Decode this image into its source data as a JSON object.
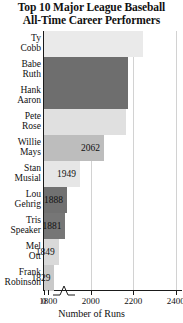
{
  "chart_data": {
    "type": "bar",
    "orientation": "horizontal",
    "title": "Top 10 Major League Baseball All-Time Career Performers",
    "title_lines": [
      "Top 10 Major League Baseball",
      "All-Time Career Performers"
    ],
    "xlabel": "Number of Runs",
    "ylabel": "",
    "categories": [
      "Ty Cobb",
      "Babe Ruth",
      "Hank Aaron",
      "Pete Rose",
      "Willie Mays",
      "Stan Musial",
      "Lou Gehrig",
      "Tris Speaker",
      "Mel Ott",
      "Frank Robinson"
    ],
    "category_lines": [
      [
        "Ty",
        "Cobb"
      ],
      [
        "Babe",
        "Ruth"
      ],
      [
        "Hank",
        "Aaron"
      ],
      [
        "Pete",
        "Rose"
      ],
      [
        "Willie",
        "Mays"
      ],
      [
        "Stan",
        "Musial"
      ],
      [
        "Lou",
        "Gehrig"
      ],
      [
        "Tris",
        "Speaker"
      ],
      [
        "Mel",
        "Ott"
      ],
      [
        "Frank",
        "Robinson"
      ]
    ],
    "values": [
      2246,
      2174,
      2174,
      2165,
      2062,
      1949,
      1888,
      1881,
      1849,
      1829
    ],
    "value_labels": [
      "",
      "",
      "",
      "",
      "2062",
      "1949",
      "1888",
      "1881",
      "1849",
      "1829"
    ],
    "bar_colors": [
      "#eaeaea",
      "#6e6e6e",
      "#6e6e6e",
      "#e0e0e0",
      "#bdbdbd",
      "#e6e6e6",
      "#717171",
      "#767676",
      "#d9d9d9",
      "#c9c9c9"
    ],
    "xticks": [
      0,
      1800,
      2000,
      2200,
      2400
    ],
    "xtick_labels": [
      "0",
      "1800",
      "2000",
      "2200",
      "2400"
    ],
    "xlim": [
      1780,
      2430
    ],
    "axis_break": true,
    "grid": true,
    "legend": "none"
  }
}
